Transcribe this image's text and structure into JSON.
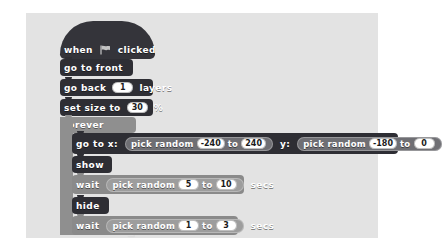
{
  "canvas": {
    "background": "#e3e3e3",
    "page_background": "#ffffff"
  },
  "palette": {
    "events_block": "#34343a",
    "looks_block": "#2e2e34",
    "control_block": "#8f8f8f",
    "motion_block": "#2e2e34",
    "operator_reporter": "#9d9d9d",
    "input_oval": "#ffffff",
    "text": "#ffffff"
  },
  "script": {
    "name": "scratch-script",
    "blocks": [
      {
        "id": "when-flag-clicked",
        "type": "hat",
        "category": "events",
        "label_before": "when",
        "icon": "green-flag-icon",
        "label_after": "clicked"
      },
      {
        "id": "go-to-front",
        "type": "stack",
        "category": "looks",
        "label": "go to front"
      },
      {
        "id": "go-back-layers",
        "type": "stack",
        "category": "looks",
        "label_before": "go back",
        "value": "1",
        "label_after": "layers"
      },
      {
        "id": "set-size-to",
        "type": "stack",
        "category": "looks",
        "label_before": "set size to",
        "value": "30",
        "label_after": "%"
      },
      {
        "id": "forever",
        "type": "c-block",
        "category": "control",
        "label": "forever",
        "loop_icon": "loop-arrow-icon",
        "children": [
          {
            "id": "go-to-xy",
            "type": "stack",
            "category": "motion",
            "label_x": "go to x:",
            "label_y": "y:",
            "x_reporter": {
              "id": "pick-random-x",
              "label": "pick random",
              "from": "-240",
              "to_label": "to",
              "to": "240"
            },
            "y_reporter": {
              "id": "pick-random-y",
              "label": "pick random",
              "from": "-180",
              "to_label": "to",
              "to": "0"
            }
          },
          {
            "id": "show",
            "type": "stack",
            "category": "looks",
            "label": "show"
          },
          {
            "id": "wait-secs-long",
            "type": "stack",
            "category": "control",
            "label_before": "wait",
            "label_after": "secs",
            "reporter": {
              "id": "pick-random-wait-long",
              "label": "pick random",
              "from": "5",
              "to_label": "to",
              "to": "10"
            }
          },
          {
            "id": "hide",
            "type": "stack",
            "category": "looks",
            "label": "hide"
          },
          {
            "id": "wait-secs-short",
            "type": "stack",
            "category": "control",
            "label_before": "wait",
            "label_after": "secs",
            "reporter": {
              "id": "pick-random-wait-short",
              "label": "pick random",
              "from": "1",
              "to_label": "to",
              "to": "3"
            }
          }
        ]
      }
    ]
  }
}
